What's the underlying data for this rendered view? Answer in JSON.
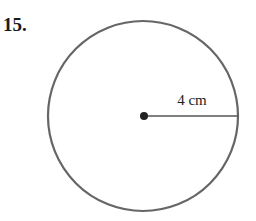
{
  "problem": {
    "number": "15."
  },
  "figure": {
    "shape": "circle",
    "center": {
      "x": 144,
      "y": 116
    },
    "radius_px": 95,
    "radius_label": "4 cm",
    "colors": {
      "outline": "#666666",
      "radius_line": "#555555",
      "center_dot": "#222222",
      "text": "#222222"
    }
  }
}
